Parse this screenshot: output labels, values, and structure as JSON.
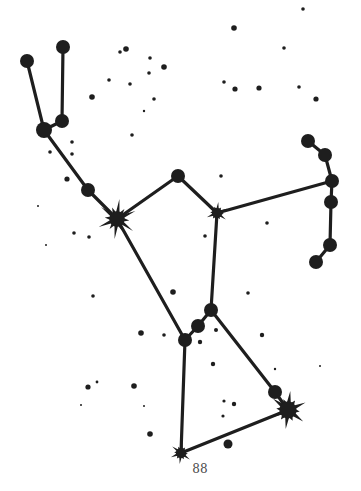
{
  "figure": {
    "page_number": "88",
    "ink_color": "#1e1e1e"
  },
  "constellation": {
    "stars": [
      {
        "id": "club-top-left",
        "x": 27,
        "y": 61,
        "r": 7,
        "kind": "dot"
      },
      {
        "id": "club-top-right",
        "x": 63,
        "y": 47,
        "r": 7,
        "kind": "dot"
      },
      {
        "id": "club-low-right",
        "x": 62,
        "y": 121,
        "r": 7,
        "kind": "dot"
      },
      {
        "id": "club-joint",
        "x": 44,
        "y": 130,
        "r": 8,
        "kind": "dot"
      },
      {
        "id": "arm-mid",
        "x": 88,
        "y": 190,
        "r": 7,
        "kind": "dot"
      },
      {
        "id": "betelgeuse",
        "x": 117,
        "y": 219,
        "r": 9,
        "kind": "starburst",
        "ray": 20
      },
      {
        "id": "meissa",
        "x": 178,
        "y": 176,
        "r": 7,
        "kind": "dot"
      },
      {
        "id": "bellatrix",
        "x": 217,
        "y": 213,
        "r": 6,
        "kind": "starburst",
        "ray": 11
      },
      {
        "id": "shield-1",
        "x": 308,
        "y": 141,
        "r": 7,
        "kind": "dot"
      },
      {
        "id": "shield-2",
        "x": 325,
        "y": 155,
        "r": 7,
        "kind": "dot"
      },
      {
        "id": "shield-3",
        "x": 332,
        "y": 181,
        "r": 7,
        "kind": "dot"
      },
      {
        "id": "shield-4",
        "x": 331,
        "y": 202,
        "r": 7,
        "kind": "dot"
      },
      {
        "id": "shield-5",
        "x": 330,
        "y": 245,
        "r": 7,
        "kind": "dot"
      },
      {
        "id": "shield-6",
        "x": 316,
        "y": 262,
        "r": 7,
        "kind": "dot"
      },
      {
        "id": "mintaka",
        "x": 211,
        "y": 310,
        "r": 7,
        "kind": "dot"
      },
      {
        "id": "alnilam",
        "x": 198,
        "y": 326,
        "r": 7,
        "kind": "dot"
      },
      {
        "id": "alnitak",
        "x": 185,
        "y": 340,
        "r": 7,
        "kind": "dot"
      },
      {
        "id": "knee-dot",
        "x": 275,
        "y": 392,
        "r": 7,
        "kind": "dot"
      },
      {
        "id": "rigel",
        "x": 288,
        "y": 410,
        "r": 10,
        "kind": "starburst",
        "ray": 19
      },
      {
        "id": "saiph",
        "x": 181,
        "y": 453,
        "r": 6,
        "kind": "starburst",
        "ray": 11
      }
    ],
    "lines": [
      [
        "club-top-left",
        "club-joint"
      ],
      [
        "club-top-right",
        "club-low-right"
      ],
      [
        "club-low-right",
        "club-joint"
      ],
      [
        "club-joint",
        "arm-mid"
      ],
      [
        "arm-mid",
        "betelgeuse"
      ],
      [
        "betelgeuse",
        "meissa"
      ],
      [
        "meissa",
        "bellatrix"
      ],
      [
        "bellatrix",
        "shield-3"
      ],
      [
        "shield-1",
        "shield-2"
      ],
      [
        "shield-2",
        "shield-3"
      ],
      [
        "shield-3",
        "shield-4"
      ],
      [
        "shield-4",
        "shield-5"
      ],
      [
        "shield-5",
        "shield-6"
      ],
      [
        "betelgeuse",
        "alnitak"
      ],
      [
        "bellatrix",
        "mintaka"
      ],
      [
        "mintaka",
        "alnilam"
      ],
      [
        "alnilam",
        "alnitak"
      ],
      [
        "mintaka",
        "knee-dot"
      ],
      [
        "knee-dot",
        "rigel"
      ],
      [
        "alnitak",
        "saiph"
      ],
      [
        "saiph",
        "rigel"
      ]
    ],
    "background_stars": [
      [
        303,
        9,
        1.8
      ],
      [
        234,
        28,
        2.8
      ],
      [
        284,
        48,
        1.8
      ],
      [
        126,
        49,
        2.8
      ],
      [
        120,
        52,
        1.8
      ],
      [
        150,
        58,
        1.8
      ],
      [
        164,
        67,
        2.8
      ],
      [
        149,
        73,
        1.8
      ],
      [
        109,
        80,
        1.8
      ],
      [
        130,
        84,
        1.8
      ],
      [
        224,
        82,
        1.8
      ],
      [
        235,
        89,
        2.6
      ],
      [
        259,
        88,
        2.6
      ],
      [
        299,
        87,
        1.8
      ],
      [
        316,
        99,
        2.6
      ],
      [
        92,
        97,
        2.8
      ],
      [
        154,
        99,
        1.8
      ],
      [
        144,
        111,
        1.2
      ],
      [
        132,
        135,
        1.8
      ],
      [
        72,
        142,
        1.8
      ],
      [
        50,
        152,
        1.8
      ],
      [
        72,
        154,
        1.8
      ],
      [
        67,
        179,
        2.6
      ],
      [
        221,
        176,
        1.8
      ],
      [
        38,
        206,
        1.0
      ],
      [
        267,
        223,
        1.8
      ],
      [
        205,
        236,
        1.8
      ],
      [
        74,
        233,
        1.8
      ],
      [
        89,
        237,
        1.8
      ],
      [
        46,
        245,
        1.0
      ],
      [
        248,
        293,
        1.8
      ],
      [
        173,
        292,
        2.8
      ],
      [
        93,
        296,
        1.8
      ],
      [
        216,
        330,
        2.0
      ],
      [
        262,
        335,
        2.2
      ],
      [
        141,
        333,
        2.8
      ],
      [
        164,
        335,
        1.8
      ],
      [
        200,
        342,
        2.2
      ],
      [
        213,
        364,
        2.2
      ],
      [
        275,
        369,
        1.2
      ],
      [
        320,
        366,
        1.0
      ],
      [
        97,
        382,
        1.4
      ],
      [
        88,
        387,
        2.6
      ],
      [
        134,
        386,
        2.8
      ],
      [
        224,
        401,
        1.6
      ],
      [
        234,
        404,
        2.2
      ],
      [
        81,
        405,
        1.0
      ],
      [
        144,
        406,
        1.0
      ],
      [
        223,
        416,
        1.6
      ],
      [
        150,
        434,
        2.8
      ],
      [
        228,
        444,
        4.5
      ]
    ]
  }
}
